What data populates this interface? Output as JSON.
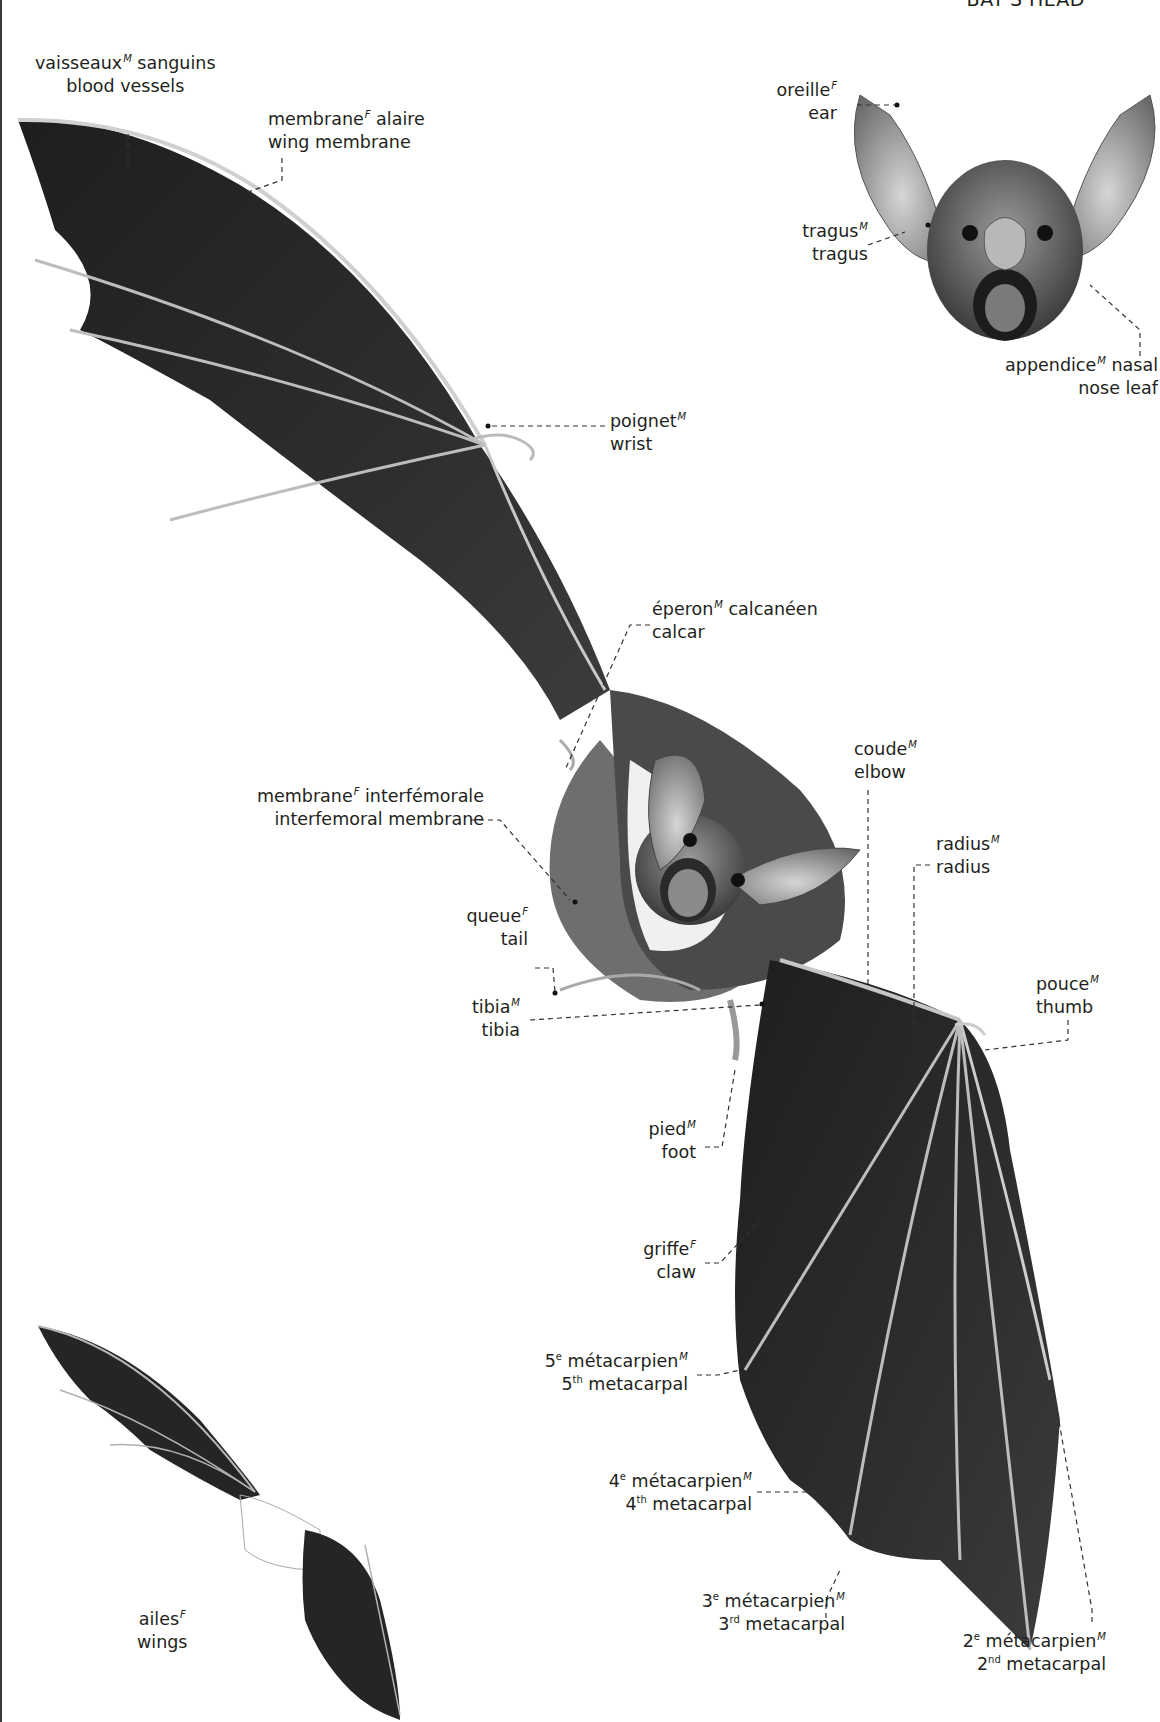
{
  "header": {
    "title": "BAT'S HEAD"
  },
  "colors": {
    "membrane": "#2b2b2b",
    "bone": "#cfcfcf",
    "fur": "#5a5a5a",
    "belly": "#f2f2f2",
    "text": "#231f20",
    "leader": "#333333"
  },
  "labels": {
    "blood_vessels": {
      "fr": "vaisseaux",
      "gender": "M",
      "fr_rest": " sanguins",
      "en": "blood vessels"
    },
    "wing_membrane": {
      "fr": "membrane",
      "gender": "F",
      "fr_rest": " alaire",
      "en": "wing membrane"
    },
    "ear": {
      "fr": "oreille",
      "gender": "F",
      "fr_rest": "",
      "en": "ear"
    },
    "tragus": {
      "fr": "tragus",
      "gender": "M",
      "fr_rest": "",
      "en": "tragus"
    },
    "nose_leaf": {
      "fr": "appendice",
      "gender": "M",
      "fr_rest": " nasal",
      "en": "nose leaf"
    },
    "wrist": {
      "fr": "poignet",
      "gender": "M",
      "fr_rest": "",
      "en": "wrist"
    },
    "calcar": {
      "fr": "éperon",
      "gender": "M",
      "fr_rest": " calcanéen",
      "en": "calcar"
    },
    "interfemoral_membrane": {
      "fr": "membrane",
      "gender": "F",
      "fr_rest": " interfémorale",
      "en": "interfemoral membrane"
    },
    "elbow": {
      "fr": "coude",
      "gender": "M",
      "fr_rest": "",
      "en": "elbow"
    },
    "radius": {
      "fr": "radius",
      "gender": "M",
      "fr_rest": "",
      "en": "radius"
    },
    "tail": {
      "fr": "queue",
      "gender": "F",
      "fr_rest": "",
      "en": "tail"
    },
    "tibia": {
      "fr": "tibia",
      "gender": "M",
      "fr_rest": "",
      "en": "tibia"
    },
    "thumb": {
      "fr": "pouce",
      "gender": "M",
      "fr_rest": "",
      "en": "thumb"
    },
    "foot": {
      "fr": "pied",
      "gender": "M",
      "fr_rest": "",
      "en": "foot"
    },
    "claw": {
      "fr": "griffe",
      "gender": "F",
      "fr_rest": "",
      "en": "claw"
    },
    "metacarpal_5": {
      "num": "5",
      "fr_ord": "e",
      "fr": " métacarpien",
      "gender": "M",
      "en_ord": "th",
      "en": " metacarpal"
    },
    "metacarpal_4": {
      "num": "4",
      "fr_ord": "e",
      "fr": " métacarpien",
      "gender": "M",
      "en_ord": "th",
      "en": " metacarpal"
    },
    "metacarpal_3": {
      "num": "3",
      "fr_ord": "e",
      "fr": " métacarpien",
      "gender": "M",
      "en_ord": "rd",
      "en": " metacarpal"
    },
    "metacarpal_2": {
      "num": "2",
      "fr_ord": "e",
      "fr": " métacarpien",
      "gender": "M",
      "en_ord": "nd",
      "en": " metacarpal"
    },
    "wings": {
      "fr": "ailes",
      "gender": "F",
      "fr_rest": "",
      "en": "wings"
    }
  }
}
